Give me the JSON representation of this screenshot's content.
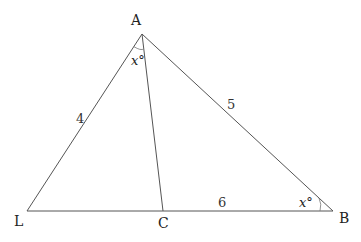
{
  "diagram": {
    "type": "triangle-geometry",
    "vertices": {
      "A": {
        "label": "A",
        "x": 142,
        "y": 34
      },
      "L": {
        "label": "L",
        "x": 27,
        "y": 211
      },
      "C": {
        "label": "C",
        "x": 163,
        "y": 211
      },
      "B": {
        "label": "B",
        "x": 333,
        "y": 211
      }
    },
    "segments": [
      {
        "from": "A",
        "to": "L"
      },
      {
        "from": "A",
        "to": "B"
      },
      {
        "from": "A",
        "to": "C"
      },
      {
        "from": "L",
        "to": "B"
      }
    ],
    "side_lengths": {
      "AL": "4",
      "AB": "5",
      "CB": "6"
    },
    "angles": {
      "LAC": "x°",
      "ABC": "x°"
    }
  }
}
